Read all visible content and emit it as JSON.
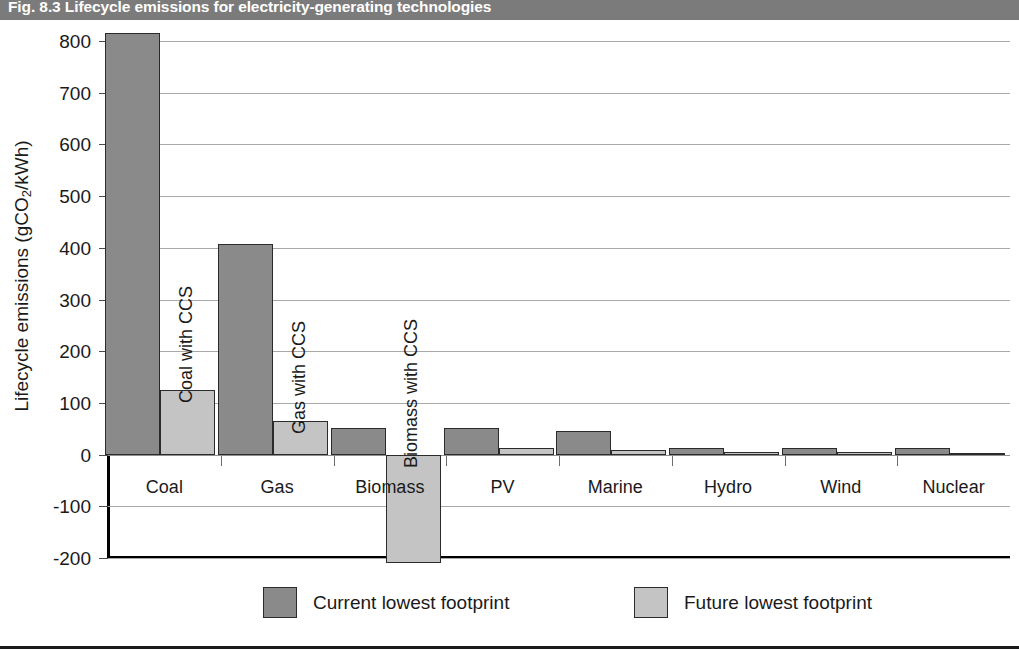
{
  "figure": {
    "number": "Fig. 8.3",
    "title": "Fig. 8.3 Lifecycle emissions for electricity-generating technologies"
  },
  "colors": {
    "banner": "#7b7b7b",
    "current_series": "#8a8a8a",
    "future_series": "#c4c4c4",
    "gridline": "#a8a8a8",
    "axis": "#000000"
  },
  "chart_data": {
    "type": "bar",
    "title": "Fig. 8.3 Lifecycle emissions for electricity-generating technologies",
    "xlabel": "",
    "ylabel": "Lifecycle emissions (gCO2/kWh)",
    "ylabel_parts": {
      "before": "Lifecycle emissions (gCO",
      "sub": "2",
      "after": "/kWh)"
    },
    "ylim": [
      -200,
      800
    ],
    "yticks": [
      800,
      700,
      600,
      500,
      400,
      300,
      200,
      100,
      0,
      -100,
      -200
    ],
    "ytick_labels": [
      "800",
      "700",
      "600",
      "500",
      "400",
      "300",
      "200",
      "100",
      "0",
      "-100",
      "-200"
    ],
    "grid": true,
    "legend_position": "bottom",
    "categories": [
      "Coal",
      "Gas",
      "Biomass",
      "PV",
      "Marine",
      "Hydro",
      "Wind",
      "Nuclear"
    ],
    "series": [
      {
        "name": "Current lowest footprint",
        "color": "#8a8a8a",
        "values": [
          815,
          407,
          52,
          52,
          46,
          13,
          13,
          13
        ]
      },
      {
        "name": "Future lowest footprint",
        "color": "#c4c4c4",
        "values": [
          125,
          65,
          -210,
          12,
          8,
          5,
          5,
          4
        ]
      }
    ],
    "annotations": [
      {
        "text": "Coal with CCS",
        "category": "Coal",
        "series": "Future lowest footprint",
        "rotation": -90
      },
      {
        "text": "Gas with CCS",
        "category": "Gas",
        "series": "Future lowest footprint",
        "rotation": -90
      },
      {
        "text": "Biomass with CCS",
        "category": "Biomass",
        "series": "Future lowest footprint",
        "rotation": -90
      }
    ]
  },
  "legend": {
    "entries": [
      {
        "label": "Current lowest footprint",
        "swatch": "current"
      },
      {
        "label": "Future lowest footprint",
        "swatch": "future"
      }
    ]
  }
}
